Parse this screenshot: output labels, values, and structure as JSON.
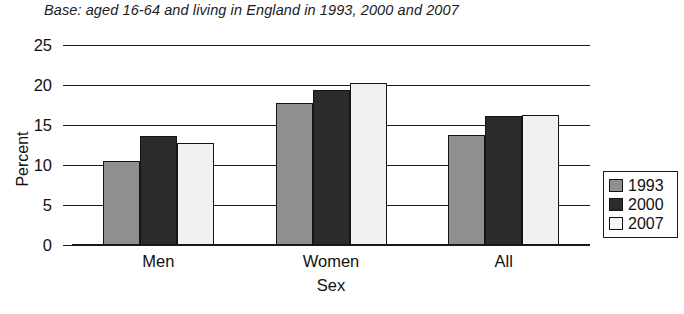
{
  "chart_data": {
    "type": "bar",
    "title": "Base: aged 16-64 and living in England in 1993, 2000 and 2007",
    "xlabel": "Sex",
    "ylabel": "Percent",
    "categories": [
      "Men",
      "Women",
      "All"
    ],
    "series": [
      {
        "name": "1993",
        "color": "#8f8f8f",
        "values": [
          10.5,
          17.7,
          13.8
        ]
      },
      {
        "name": "2000",
        "color": "#2b2b2b",
        "values": [
          13.6,
          19.4,
          16.1
        ]
      },
      {
        "name": "2007",
        "color": "#f1f1f1",
        "values": [
          12.8,
          20.2,
          16.3
        ]
      }
    ],
    "ylim": [
      0,
      25
    ],
    "yticks": [
      0,
      5,
      10,
      15,
      20,
      25
    ],
    "ytick_labels": [
      "0",
      "5",
      "10",
      "15",
      "20",
      "25"
    ],
    "grid": true,
    "grid_axis": "y",
    "legend_position": "right"
  }
}
